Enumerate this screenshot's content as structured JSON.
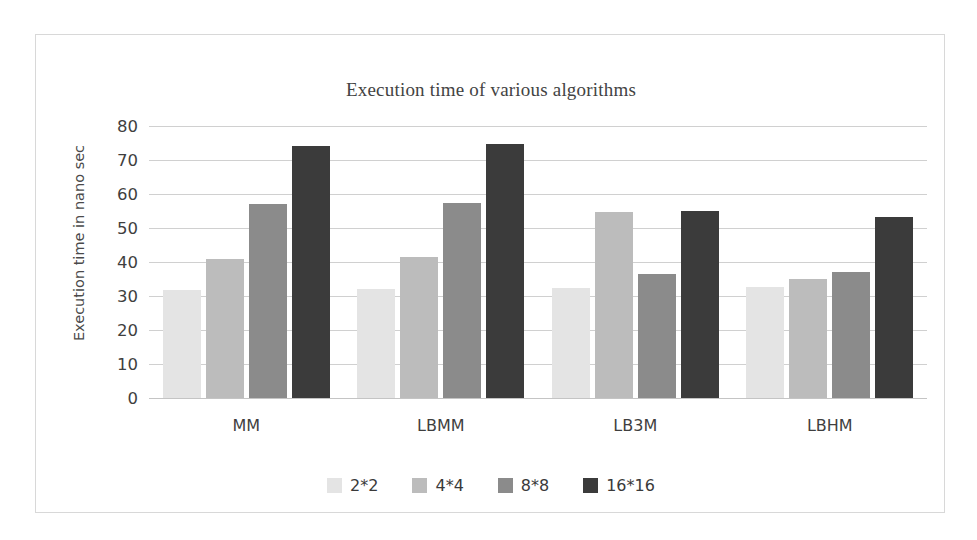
{
  "chart_data": {
    "type": "bar",
    "title": "Execution time of various algorithms",
    "xlabel": "",
    "ylabel": "Execution time in nano sec",
    "categories": [
      "MM",
      "LBMM",
      "LB3M",
      "LBHM"
    ],
    "ylim": [
      0,
      80
    ],
    "yticks": [
      0,
      10,
      20,
      30,
      40,
      50,
      60,
      70,
      80
    ],
    "grid": true,
    "legend_position": "bottom",
    "series": [
      {
        "name": "2*2",
        "color": "#e4e4e4",
        "values": [
          31.8,
          32.0,
          32.3,
          32.6
        ]
      },
      {
        "name": "4*4",
        "color": "#bcbcbc",
        "values": [
          41.0,
          41.4,
          54.7,
          35.0
        ]
      },
      {
        "name": "8*8",
        "color": "#8b8b8b",
        "values": [
          57.2,
          57.5,
          36.5,
          37.0
        ]
      },
      {
        "name": "16*16",
        "color": "#3b3b3b",
        "values": [
          74.2,
          74.6,
          55.0,
          53.2
        ]
      }
    ]
  },
  "colors": {
    "series_2x2": "#e4e4e4",
    "series_4x4": "#bcbcbc",
    "series_8x8": "#8b8b8b",
    "series_16x16": "#3b3b3b",
    "gridline": "#d0d0d0",
    "frame_border": "#d8d8d8",
    "text": "#3f3f3f",
    "background": "#ffffff"
  }
}
